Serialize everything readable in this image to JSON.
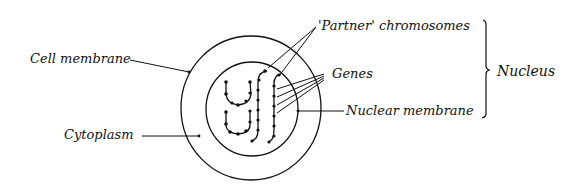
{
  "labels": {
    "cell_membrane": "Cell membrane",
    "cytoplasm": "Cytoplasm",
    "partner_chromosomes": "'Partner' chromosomes",
    "genes": "Genes",
    "nuclear_membrane": "Nuclear membrane",
    "nucleus": "Nucleus"
  },
  "colors": {
    "ink": "#111111",
    "background": "#ffffff"
  }
}
